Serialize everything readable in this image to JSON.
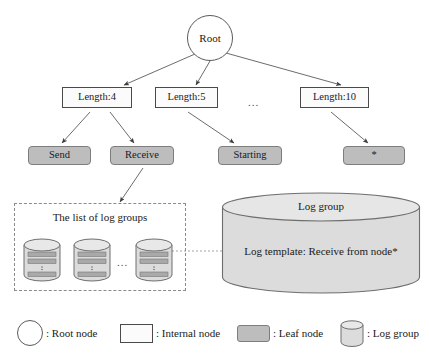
{
  "tree": {
    "root": {
      "label": "Root",
      "shape": "circle"
    },
    "internal_nodes": [
      {
        "label": "Length:4"
      },
      {
        "label": "Length:5"
      },
      {
        "label": "Length:10"
      }
    ],
    "internal_ellipsis": "...",
    "leaf_nodes": [
      {
        "label": "Send"
      },
      {
        "label": "Receive"
      },
      {
        "label": "Starting"
      },
      {
        "label": "*"
      }
    ]
  },
  "list_panel": {
    "title": "The list of log groups",
    "ellipsis": "...",
    "group_count": 3
  },
  "log_group": {
    "top_label": "Log group",
    "body_label": "Log template: Receive from node*"
  },
  "legend": {
    "items": [
      {
        "icon": "circle-icon",
        "label": ": Root node"
      },
      {
        "icon": "rectangle-icon",
        "label": ": Internal node"
      },
      {
        "icon": "rounded-filled-rectangle-icon",
        "label": ": Leaf node"
      },
      {
        "icon": "cylinder-icon",
        "label": ": Log group"
      }
    ]
  },
  "colors": {
    "leaf_fill": "#bdbdbd",
    "internal_fill": "#fbfbfb",
    "cylinder_fill": "#dcdcdc",
    "stroke": "#4a4a4a",
    "dashed_stroke": "#8a8a8a"
  }
}
